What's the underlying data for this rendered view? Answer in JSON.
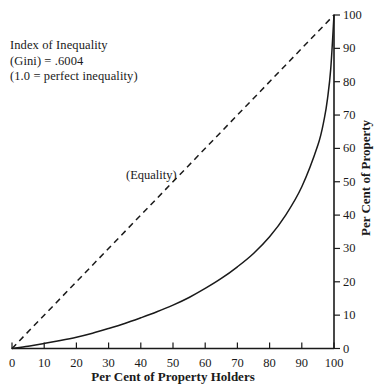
{
  "chart_data": {
    "type": "line",
    "title": "",
    "xlabel": "Per Cent of Property Holders",
    "ylabel": "Per Cent of Property",
    "xlim": [
      0,
      100
    ],
    "ylim": [
      0,
      100
    ],
    "grid": false,
    "legend_position": "inline-annotation",
    "x_ticks": [
      0,
      10,
      20,
      30,
      40,
      50,
      60,
      70,
      80,
      90,
      100
    ],
    "x_tick_labels": [
      "0",
      "10",
      "20",
      "30",
      "40",
      "50",
      "60",
      "70",
      "80",
      "90",
      "100"
    ],
    "y_ticks": [
      0,
      10,
      20,
      30,
      40,
      50,
      60,
      70,
      80,
      90,
      100
    ],
    "y_tick_labels": [
      "0",
      "10",
      "20",
      "30",
      "40",
      "50",
      "60",
      "70",
      "80",
      "90",
      "100"
    ],
    "y_axis_side": "right",
    "series": [
      {
        "name": "Lorenz curve",
        "style": "solid",
        "color": "#1a1a1a",
        "x": [
          0,
          5,
          10,
          15,
          20,
          25,
          30,
          35,
          40,
          45,
          50,
          55,
          60,
          65,
          70,
          75,
          80,
          85,
          90,
          95,
          97,
          98,
          99,
          100
        ],
        "values": [
          0,
          0.7,
          1.5,
          2.4,
          3.4,
          4.6,
          6.0,
          7.5,
          9.2,
          11.0,
          13.0,
          15.3,
          18.0,
          21.0,
          24.5,
          28.5,
          33.5,
          40.0,
          48.5,
          61.0,
          69.0,
          75.0,
          84.0,
          100
        ]
      },
      {
        "name": "(Equality)",
        "style": "dashed",
        "color": "#1a1a1a",
        "x": [
          0,
          100
        ],
        "values": [
          0,
          100
        ]
      }
    ],
    "annotations": [
      "Index of Inequality",
      "(Gini)  =  .6004",
      "(1.0  =  perfect inequality)"
    ],
    "equality_label": "(Equality)",
    "gini": 0.6004
  },
  "colors": {
    "background": "#ffffff",
    "ink": "#1a1a1a",
    "axis": "#1a1a1a"
  }
}
